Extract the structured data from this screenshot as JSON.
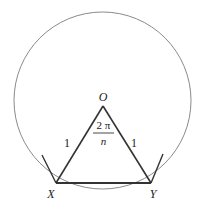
{
  "diagram": {
    "labels": {
      "center": "O",
      "vertex_left": "X",
      "vertex_right": "Y",
      "side_left": "1",
      "side_right": "1",
      "angle_numerator": "2 π",
      "angle_denominator": "n"
    },
    "colors": {
      "circle": "#8a8a8a",
      "lines": "#333333",
      "text": "#222222"
    }
  }
}
